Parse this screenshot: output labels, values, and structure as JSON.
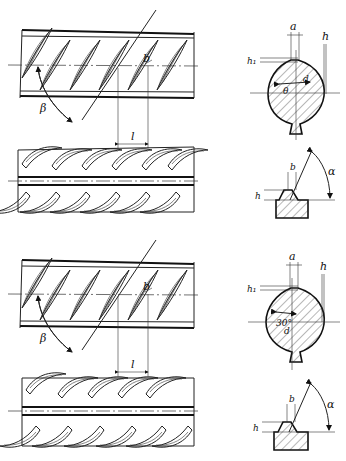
{
  "figure": {
    "variants": [
      {
        "id": "variant-1",
        "side_view_labels": {
          "rib_width": "b",
          "rib_angle": "β",
          "rib_spacing": "l"
        },
        "cross_section_labels": {
          "top_width": "a",
          "transverse_height": "h₁",
          "rib_height": "h",
          "diameter": "d",
          "angle": "θ"
        },
        "rib_profile_labels": {
          "width": "b",
          "height": "h",
          "angle": "α"
        }
      },
      {
        "id": "variant-2",
        "side_view_labels": {
          "rib_width": "b",
          "rib_angle": "β",
          "rib_spacing": "l"
        },
        "cross_section_labels": {
          "top_width": "a",
          "transverse_height": "h₁",
          "rib_height": "h",
          "diameter": "d",
          "angle": "30°"
        },
        "rib_profile_labels": {
          "width": "b",
          "height": "h",
          "angle": "α"
        }
      }
    ]
  }
}
